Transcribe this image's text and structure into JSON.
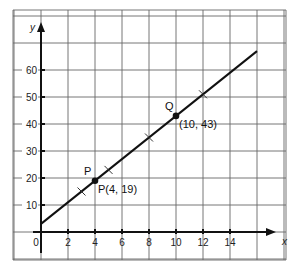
{
  "chart_data": {
    "type": "line",
    "title": "",
    "xlabel": "x",
    "ylabel": "y",
    "xlim": [
      -1,
      18
    ],
    "ylim": [
      -10,
      80
    ],
    "grid": true,
    "x_ticks": [
      0,
      2,
      4,
      6,
      8,
      10,
      12,
      14
    ],
    "x_tick_labels": [
      "0",
      "2",
      "4",
      "6",
      "8",
      "10",
      "12",
      "14"
    ],
    "y_ticks": [
      10,
      20,
      30,
      40,
      50,
      60
    ],
    "y_tick_labels": [
      "10",
      "20",
      "30",
      "40",
      "50",
      "60"
    ],
    "series": [
      {
        "name": "line y = 4x + 3",
        "x": [
          0,
          16
        ],
        "y": [
          3,
          67
        ]
      }
    ],
    "points": [
      {
        "name": "P",
        "x": 4,
        "y": 19,
        "label": "P",
        "coord_label": "P(4, 19)"
      },
      {
        "name": "Q",
        "x": 10,
        "y": 43,
        "label": "Q",
        "coord_label": "(10, 43)"
      }
    ],
    "cross_marks": [
      {
        "x": 3,
        "y": 15
      },
      {
        "x": 5,
        "y": 23
      },
      {
        "x": 8,
        "y": 35
      },
      {
        "x": 12,
        "y": 51
      }
    ],
    "colors": {
      "line": "#111111",
      "grid": "#555555",
      "axis": "#111111"
    }
  }
}
